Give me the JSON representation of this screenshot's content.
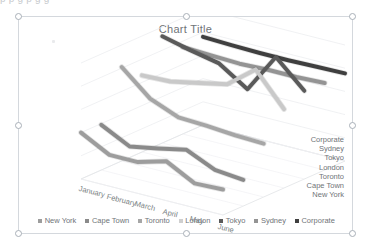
{
  "document": {
    "cut_off_text_line": "p      p    g          p            g                    g"
  },
  "chart_object": {
    "selected": true,
    "handle_names": [
      "top-left",
      "top-center",
      "top-right",
      "middle-left",
      "middle-right",
      "bottom-left",
      "bottom-center",
      "bottom-right"
    ]
  },
  "chart_data": {
    "type": "line",
    "subtype": "3-D line",
    "title": "Chart Title",
    "xlabel": "",
    "ylabel": "",
    "grid": true,
    "legend_position": "bottom",
    "ylim": [
      0,
      10000
    ],
    "yticks": [
      "10,000",
      "8,000",
      "6,000",
      "4,000",
      "2,000",
      "0"
    ],
    "ytick_values": [
      10000,
      8000,
      6000,
      4000,
      2000,
      0
    ],
    "categories": [
      "January",
      "February",
      "March",
      "April",
      "May",
      "June"
    ],
    "depth_axis_labels": [
      "Corporate",
      "Sydney",
      "Tokyo",
      "London",
      "Toronto",
      "Cape Town",
      "New York"
    ],
    "series": [
      {
        "name": "New York",
        "color": "#9d9d9d",
        "values": [
          4000,
          2700,
          2700,
          3400,
          2100,
          2200
        ]
      },
      {
        "name": "Cape Town",
        "color": "#8a8a8a",
        "values": [
          3900,
          2650,
          3100,
          3600,
          2500,
          2250
        ]
      },
      {
        "name": "Toronto",
        "color": "#a6a6a6",
        "values": [
          8100,
          6000,
          5000,
          4900,
          4700,
          4600
        ]
      },
      {
        "name": "London",
        "color": "#c9c9c9",
        "values": [
          6600,
          6700,
          7200,
          7700,
          9600,
          6800
        ]
      },
      {
        "name": "Tokyo",
        "color": "#5a5a5a",
        "values": [
          9200,
          8600,
          8100,
          6500,
          9900,
          7600
        ]
      },
      {
        "name": "Sydney",
        "color": "#949494",
        "values": [
          7500,
          7400,
          7300,
          7400,
          7400,
          7500
        ]
      },
      {
        "name": "Corporate",
        "color": "#3f3f3f",
        "values": [
          7600,
          7500,
          7450,
          7450,
          7500,
          7550
        ]
      }
    ]
  },
  "legend": {
    "items": [
      {
        "label": "New York",
        "color": "#9d9d9d"
      },
      {
        "label": "Cape Town",
        "color": "#8a8a8a"
      },
      {
        "label": "Toronto",
        "color": "#a6a6a6"
      },
      {
        "label": "London",
        "color": "#cfcfcf"
      },
      {
        "label": "Tokyo",
        "color": "#5a5a5a"
      },
      {
        "label": "Sydney",
        "color": "#949494"
      },
      {
        "label": "Corporate",
        "color": "#3f3f3f"
      }
    ]
  }
}
